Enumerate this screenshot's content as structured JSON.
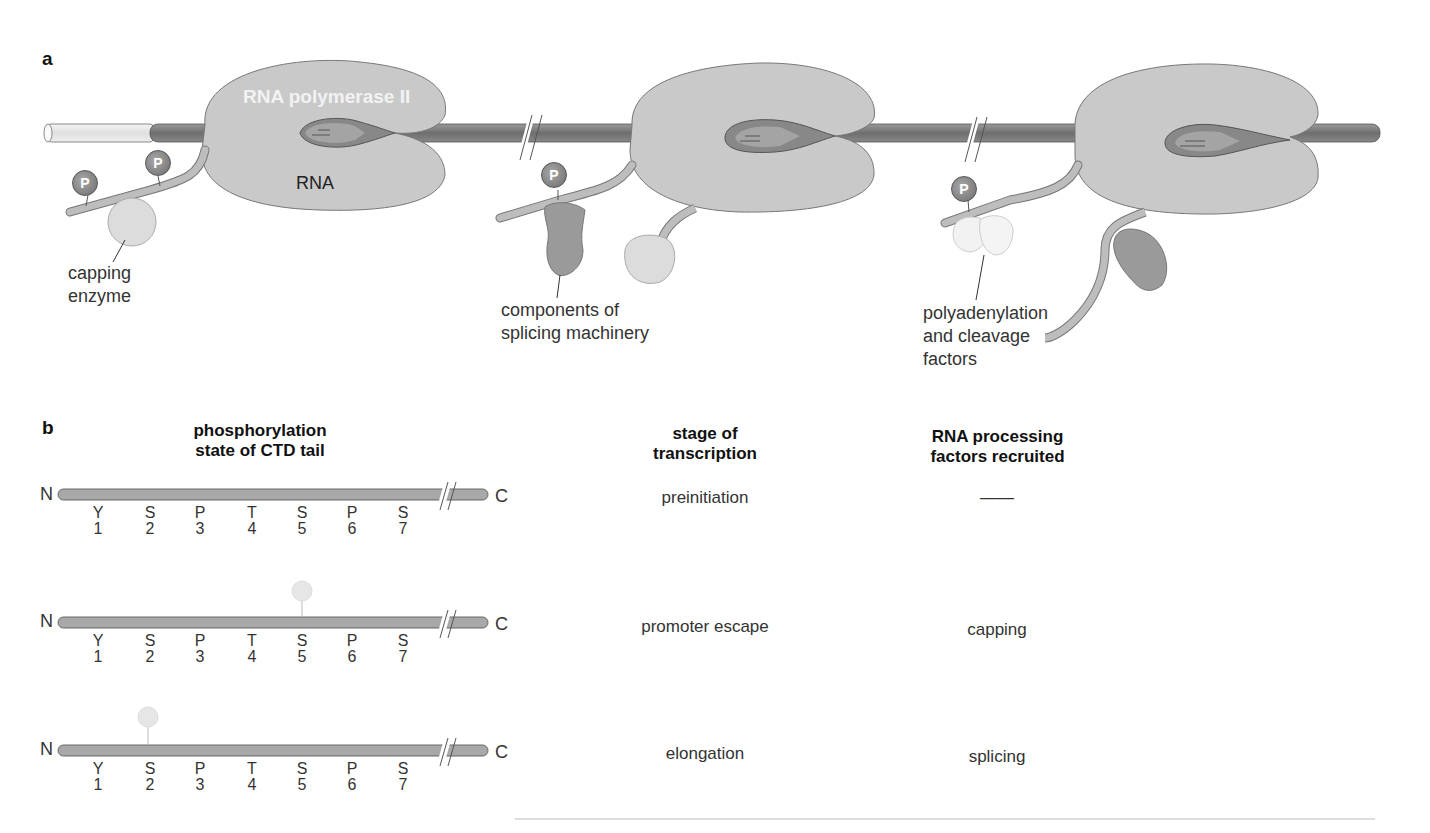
{
  "panel_a": {
    "letter": "a",
    "title_label": "RNA polymerase II",
    "rna_label": "RNA",
    "phospho_label": "P",
    "stages": [
      {
        "factor_label_lines": [
          "capping",
          "enzyme"
        ]
      },
      {
        "factor_label_lines": [
          "components of",
          "splicing machinery"
        ]
      },
      {
        "factor_label_lines": [
          "polyadenylation",
          "and cleavage",
          "factors"
        ]
      }
    ],
    "colors": {
      "polymerase": "#c8c8c8",
      "dna": "#7a7a7a",
      "phospho": "#8c8c8c",
      "tail": "#b0b0b0"
    }
  },
  "panel_b": {
    "letter": "b",
    "headers": {
      "ctd": [
        "phosphorylation",
        "state of CTD tail"
      ],
      "stage": [
        "stage of",
        "transcription"
      ],
      "factors": [
        "RNA processing",
        "factors recruited"
      ]
    },
    "n_terminal": "N",
    "c_terminal": "C",
    "residues": [
      {
        "aa": "Y",
        "pos": "1"
      },
      {
        "aa": "S",
        "pos": "2"
      },
      {
        "aa": "P",
        "pos": "3"
      },
      {
        "aa": "T",
        "pos": "4"
      },
      {
        "aa": "S",
        "pos": "5"
      },
      {
        "aa": "P",
        "pos": "6"
      },
      {
        "aa": "S",
        "pos": "7"
      }
    ],
    "rows": [
      {
        "stage": "preinitiation",
        "factors": "——",
        "phosphorylated_residue": null
      },
      {
        "stage": "promoter escape",
        "factors": "capping",
        "phosphorylated_residue": "S5"
      },
      {
        "stage": "elongation",
        "factors": "splicing",
        "phosphorylated_residue": "S2"
      }
    ]
  }
}
